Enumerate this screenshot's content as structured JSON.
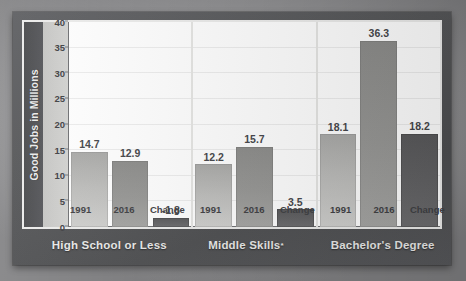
{
  "chart_data": {
    "type": "bar",
    "title": "",
    "subtitle": "",
    "xlabel": "",
    "ylabel": "Good Jobs in Millions",
    "ylim": [
      0,
      40
    ],
    "yticks": [
      40,
      35,
      30,
      25,
      20,
      15,
      10,
      5,
      0
    ],
    "grid": true,
    "legend": "none",
    "group_separators": true,
    "categories": [
      "High School or Less",
      "Middle Skills*",
      "Bachelor's Degree"
    ],
    "series": [
      {
        "name": "1991",
        "values": [
          14.7,
          12.2,
          18.1
        ]
      },
      {
        "name": "2016",
        "values": [
          12.9,
          15.7,
          36.3
        ]
      },
      {
        "name": "Change",
        "values": [
          -1.8,
          3.5,
          18.2
        ]
      }
    ],
    "groups": [
      {
        "category": "High School or Less",
        "category_footnote": "",
        "bars": [
          {
            "series": "1991",
            "label": "14.7",
            "value": 14.7,
            "plotted_height": 14.7
          },
          {
            "series": "2016",
            "label": "12.9",
            "value": 12.9,
            "plotted_height": 12.9
          },
          {
            "series": "Change",
            "label": "-1.8",
            "value": -1.8,
            "plotted_height": 1.8
          }
        ]
      },
      {
        "category": "Middle Skills",
        "category_footnote": "*",
        "bars": [
          {
            "series": "1991",
            "label": "12.2",
            "value": 12.2,
            "plotted_height": 12.2
          },
          {
            "series": "2016",
            "label": "15.7",
            "value": 15.7,
            "plotted_height": 15.7
          },
          {
            "series": "Change",
            "label": "3.5",
            "value": 3.5,
            "plotted_height": 3.5
          }
        ]
      },
      {
        "category": "Bachelor's Degree",
        "category_footnote": "",
        "bars": [
          {
            "series": "1991",
            "label": "18.1",
            "value": 18.1,
            "plotted_height": 18.1
          },
          {
            "series": "2016",
            "label": "36.3",
            "value": 36.3,
            "plotted_height": 36.3
          },
          {
            "series": "Change",
            "label": "18.2",
            "value": 18.2,
            "plotted_height": 18.2
          }
        ]
      }
    ],
    "colors": {
      "bar_1991": "#bdbdbb",
      "bar_2016": "#979795",
      "bar_change": "#62626 4",
      "plot_background": "#ffffff",
      "panel_background": "#56575a",
      "frame_border": "#ececeb",
      "gridline": "#ededed",
      "axis_line": "#6f7073",
      "value_text": "#45464a",
      "category_text": "#e9e9e8"
    }
  }
}
